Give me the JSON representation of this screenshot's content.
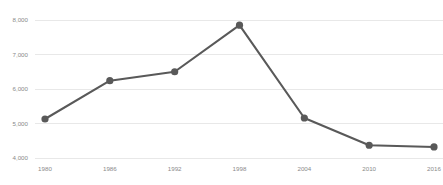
{
  "chart_data": {
    "type": "line",
    "title": "",
    "subtitle": "",
    "xlabel": "",
    "ylabel": "",
    "x": [
      1980,
      1986,
      1992,
      1998,
      2004,
      2010,
      2016
    ],
    "categories": [
      "1980",
      "1986",
      "1992",
      "1998",
      "2004",
      "2010",
      "2016"
    ],
    "values": [
      5130,
      6240,
      6500,
      7850,
      5160,
      4370,
      4320
    ],
    "series": [
      {
        "name": "",
        "values": [
          5130,
          6240,
          6500,
          7850,
          5160,
          4370,
          4320
        ]
      }
    ],
    "ylim": [
      4000,
      8000
    ],
    "xlim": [
      1980,
      2016
    ],
    "y_ticks": [
      4000,
      5000,
      6000,
      7000,
      8000
    ],
    "y_tick_labels": [
      "4,000",
      "5,000",
      "6,000",
      "7,000",
      "8,000"
    ],
    "x_ticks": [
      1980,
      1986,
      1992,
      1998,
      2004,
      2010,
      2016
    ],
    "x_tick_labels": [
      "1980",
      "1986",
      "1992",
      "1998",
      "2004",
      "2010",
      "2016"
    ],
    "grid": "horizontal",
    "legend": "none",
    "line_color": "#595959",
    "marker_color": "#595959",
    "marker_shape": "circle",
    "grid_color": "#e8e8e8",
    "tick_label_color": "#8a8a8a",
    "background_color": "#ffffff"
  }
}
